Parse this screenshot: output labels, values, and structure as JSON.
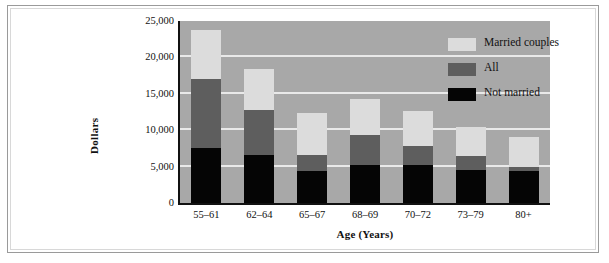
{
  "chart_data": {
    "type": "bar",
    "subtype": "stacked-overlay",
    "title": "",
    "xlabel": "Age (Years)",
    "ylabel": "Dollars",
    "categories": [
      "55–61",
      "62–64",
      "65–67",
      "68–69",
      "70–72",
      "73–79",
      "80+"
    ],
    "series": [
      {
        "name": "Not married",
        "color": "#050505",
        "values": [
          7500,
          6600,
          4400,
          5200,
          5200,
          4500,
          4400
        ]
      },
      {
        "name": "All",
        "color": "#5e5e5e",
        "values": [
          17000,
          12800,
          6600,
          9400,
          7900,
          6400,
          5000
        ]
      },
      {
        "name": "Married couples",
        "color": "#dcdcdc",
        "values": [
          23700,
          18400,
          12400,
          14300,
          12600,
          10500,
          9100
        ]
      }
    ],
    "ylim": [
      0,
      25000
    ],
    "ytick_values": [
      0,
      5000,
      10000,
      15000,
      20000,
      25000
    ],
    "ytick_labels": [
      "0",
      "5,000",
      "10,000",
      "15,000",
      "20,000",
      "25,000"
    ],
    "grid": true,
    "grid_color": "#e9e9e9",
    "plot_background": "#a8a8a8",
    "legend_position": "top-right",
    "legend": [
      {
        "label": "Married couples",
        "color": "#dcdcdc",
        "swatch": "married"
      },
      {
        "label": "All",
        "color": "#5e5e5e",
        "swatch": "all"
      },
      {
        "label": "Not married",
        "color": "#050505",
        "swatch": "notmarried"
      }
    ]
  }
}
